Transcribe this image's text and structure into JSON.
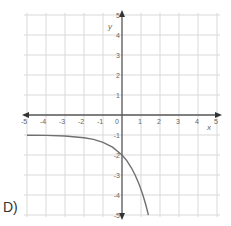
{
  "option_label": "D)",
  "colors": {
    "grid": "#d9d9d9",
    "axis": "#555555",
    "curve": "#707070",
    "text": "#666666"
  },
  "chart_data": {
    "type": "line",
    "title": "",
    "xlabel": "x",
    "ylabel": "y",
    "xlim": [
      -5,
      5
    ],
    "ylim": [
      -5,
      5
    ],
    "grid": true,
    "x_ticks": [
      -5,
      -4,
      -3,
      -2,
      -1,
      0,
      1,
      2,
      3,
      4,
      5
    ],
    "y_ticks": [
      -5,
      -4,
      -3,
      -2,
      -1,
      1,
      2,
      3,
      4,
      5
    ],
    "series": [
      {
        "name": "curve",
        "description": "decreasing exponential with horizontal asymptote y = -1, y-intercept -2",
        "x": [
          -5,
          -4,
          -3,
          -2,
          -1.5,
          -1,
          -0.5,
          0,
          0.25,
          0.5,
          0.69,
          0.9,
          1.1,
          1.25,
          1.39
        ],
        "y": [
          -1.01,
          -1.02,
          -1.05,
          -1.14,
          -1.22,
          -1.37,
          -1.61,
          -2,
          -2.28,
          -2.65,
          -3,
          -3.46,
          -4,
          -4.49,
          -5
        ]
      }
    ]
  }
}
